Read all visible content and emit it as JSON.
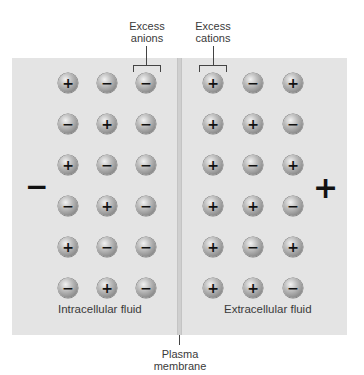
{
  "labels": {
    "excess_anions": "Excess anions",
    "excess_anions_line1": "Excess",
    "excess_anions_line2": "anions",
    "excess_cations_line1": "Excess",
    "excess_cations_line2": "cations",
    "intracellular": "Intracellular fluid",
    "extracellular": "Extracellular fluid",
    "membrane_line1": "Plasma",
    "membrane_line2": "membrane"
  },
  "side_signs": {
    "left": "−",
    "right": "+"
  },
  "colors": {
    "panel": "#e4e4e4",
    "membrane": "#cfcfcf",
    "ion_gradient_light": "#f2f2f2",
    "ion_gradient_dark": "#6e6e6e"
  },
  "intracellular_ions": [
    [
      "+",
      "−",
      "−"
    ],
    [
      "−",
      "+",
      "−"
    ],
    [
      "+",
      "−",
      "−"
    ],
    [
      "−",
      "+",
      "−"
    ],
    [
      "+",
      "−",
      "−"
    ],
    [
      "−",
      "+",
      "−"
    ]
  ],
  "extracellular_ions": [
    [
      "+",
      "−",
      "+"
    ],
    [
      "+",
      "+",
      "−"
    ],
    [
      "+",
      "−",
      "+"
    ],
    [
      "+",
      "+",
      "−"
    ],
    [
      "+",
      "−",
      "+"
    ],
    [
      "+",
      "+",
      "−"
    ]
  ]
}
